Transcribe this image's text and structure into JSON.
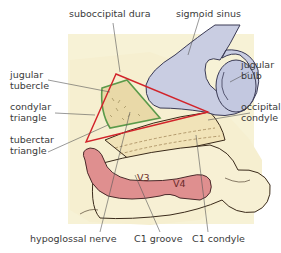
{
  "figure": {
    "type": "anatomical illustration",
    "colors": {
      "background_panel": "#f7f2d6",
      "bone": "#f6efd0",
      "bone_outline": "#3a2a1a",
      "sigmoid_sinus": "#c9cde2",
      "artery": "#df8f8f",
      "red_triangle": "#d2232a",
      "green_triangle": "#5b9a4a",
      "leader_line": "#555555",
      "label_text": "#3a3a3a"
    }
  },
  "labels": {
    "suboccipital_dura": "suboccipital dura",
    "sigmoid_sinus": "sigmoid sinus",
    "jugular_tubercle": [
      "jugular",
      "tubercle"
    ],
    "jugular_bulb": [
      "jugular",
      "bulb"
    ],
    "condylar_triangle": [
      "condylar",
      "triangle"
    ],
    "occipital_condyle": [
      "occipital",
      "condyle"
    ],
    "tuberctar_triangle": [
      "tuberctar",
      "triangle"
    ],
    "hypoglossal_nerve": "hypoglossal nerve",
    "c1_groove": "C1 groove",
    "c1_condyle": "C1 condyle",
    "v3": "V3",
    "v4": "V4"
  }
}
